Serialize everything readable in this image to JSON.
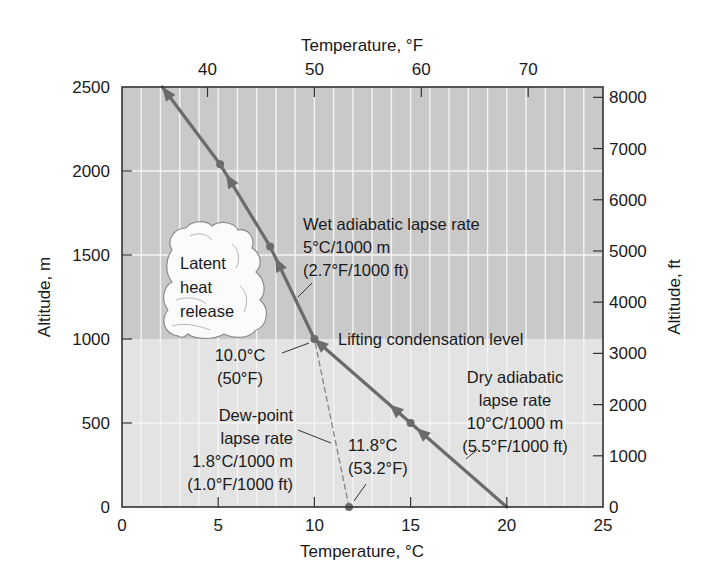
{
  "chart_data": {
    "type": "line",
    "title": "",
    "xlabel": "Temperature, °C",
    "x2label": "Temperature, °F",
    "ylabel": "Altitude, m",
    "y2label": "Altitude, ft",
    "xlim": [
      0,
      25
    ],
    "ylim": [
      0,
      2500
    ],
    "x_ticks": [
      0,
      5,
      10,
      15,
      20,
      25
    ],
    "y_ticks": [
      0,
      500,
      1000,
      1500,
      2000,
      2500
    ],
    "x2_ticks_F": [
      40,
      50,
      60,
      70
    ],
    "y2_ticks_ft": [
      0,
      1000,
      2000,
      3000,
      4000,
      5000,
      6000,
      7000,
      8000
    ],
    "grid": true,
    "regions": [
      {
        "name": "above lifting condensation level",
        "y_from": 1000,
        "y_to": 2500,
        "color": "#c9c9c9"
      },
      {
        "name": "below lifting condensation level",
        "y_from": 0,
        "y_to": 1000,
        "color": "#e3e3e3"
      }
    ],
    "series": [
      {
        "name": "Dry adiabatic lapse rate",
        "style": "solid",
        "x": [
          20,
          15,
          10
        ],
        "y": [
          0,
          500,
          1000
        ]
      },
      {
        "name": "Wet adiabatic lapse rate",
        "style": "solid",
        "x": [
          10,
          7.7,
          5.1,
          2.1
        ],
        "y": [
          1000,
          1550,
          2040,
          2500
        ]
      },
      {
        "name": "Dew-point lapse rate",
        "style": "dashed",
        "x": [
          11.8,
          10
        ],
        "y": [
          0,
          1000
        ]
      }
    ],
    "markers": [
      {
        "x": 15,
        "y": 500
      },
      {
        "x": 10,
        "y": 1000
      },
      {
        "x": 7.7,
        "y": 1550
      },
      {
        "x": 5.1,
        "y": 2040
      },
      {
        "x": 11.8,
        "y": 0
      }
    ],
    "annotations": {
      "wet": [
        "Wet adiabatic lapse rate",
        "5°C/1000 m",
        "(2.7°F/1000 ft)"
      ],
      "lcl": "Lifting condensation level",
      "lcl_temp": [
        "10.0°C",
        "(50°F)"
      ],
      "dry": [
        "Dry adiabatic",
        "lapse rate",
        "10°C/1000 m",
        "(5.5°F/1000 ft)"
      ],
      "dew": [
        "Dew-point",
        "lapse rate",
        "1.8°C/1000 m",
        "(1.0°F/1000 ft)"
      ],
      "surface_dew": [
        "11.8°C",
        "(53.2°F)"
      ],
      "cloud": [
        "Latent",
        "heat",
        "release"
      ]
    },
    "colors": {
      "line": "#6b6b6b",
      "axis": "#333333",
      "grid": "#f4f4f4",
      "cloud": "#fbfbfb",
      "cloud_outline": "#8a8a8a"
    }
  }
}
